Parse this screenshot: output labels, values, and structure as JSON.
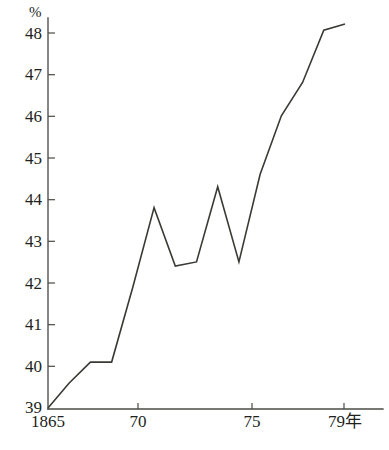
{
  "chart_data": {
    "type": "line",
    "title": "",
    "subtitle": "",
    "xlabel": "年",
    "ylabel": "%",
    "unit_label": "%",
    "grid": false,
    "legend": null,
    "xlim": [
      1865,
      1879
    ],
    "ylim": [
      39,
      48.5
    ],
    "y_ticks": [
      39,
      40,
      41,
      42,
      43,
      44,
      45,
      46,
      47,
      48
    ],
    "y_tick_labels": [
      "39",
      "40",
      "41",
      "42",
      "43",
      "44",
      "45",
      "46",
      "47",
      "48"
    ],
    "x_ticks": [
      1865,
      1870,
      1875,
      1879
    ],
    "x_tick_labels": [
      "1865",
      "70",
      "75",
      "79年"
    ],
    "x": [
      1865,
      1866,
      1867,
      1868,
      1869,
      1870,
      1871,
      1872,
      1873,
      1874,
      1875,
      1876,
      1877,
      1878,
      1879
    ],
    "values": [
      39.0,
      39.6,
      40.1,
      40.1,
      41.9,
      43.8,
      42.4,
      42.5,
      44.3,
      42.5,
      44.6,
      46.0,
      46.8,
      48.05,
      48.2
    ],
    "series": [
      {
        "name": "series-1",
        "color": "#3a3a35",
        "values": [
          39.0,
          39.6,
          40.1,
          40.1,
          41.9,
          43.8,
          42.4,
          42.5,
          44.3,
          42.5,
          44.6,
          46.0,
          46.8,
          48.05,
          48.2
        ]
      }
    ],
    "colors": {
      "line": "#3a3a35",
      "axis": "#4a4a45",
      "text": "#221f1c",
      "background": "#ffffff"
    },
    "annotations": []
  }
}
